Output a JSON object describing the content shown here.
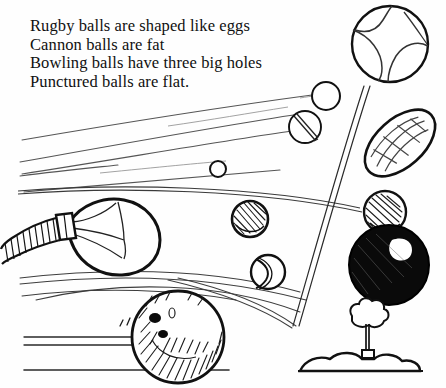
{
  "page": {
    "width": 446,
    "height": 388,
    "background_color": "#fefefe",
    "ink_color": "#111111",
    "faint_ink_color": "#555555"
  },
  "caption": {
    "lines": [
      "Rugby balls are shaped like eggs",
      "Cannon balls are fat",
      "Bowling balls have three big holes",
      "Punctured balls are flat."
    ]
  },
  "illustration": {
    "title": "Hand-drawn line illustration of assorted balls",
    "objects": [
      {
        "name": "tennis-ball",
        "label": "Tennis ball with curved seams",
        "cx": 390,
        "cy": 44,
        "r": 38
      },
      {
        "name": "rugby-ball",
        "label": "Rugby ball shaped like an egg",
        "cx": 400,
        "cy": 143,
        "rx": 40,
        "ry": 23,
        "rotation": -42
      },
      {
        "name": "cannon-ball",
        "label": "Cannon ball, solid black and fat",
        "cx": 389,
        "cy": 265,
        "r": 40
      },
      {
        "name": "bowling-ball",
        "label": "Bowling ball with three big holes",
        "cx": 178,
        "cy": 337,
        "r": 46
      },
      {
        "name": "punctured-ball",
        "label": "Punctured ball, flat deflated balloon",
        "cx": 115,
        "cy": 235,
        "rx": 42,
        "ry": 32
      },
      {
        "name": "shaded-ball-small",
        "label": "Small hatched ball",
        "cx": 250,
        "cy": 219,
        "r": 18
      },
      {
        "name": "seam-ball",
        "label": "Ball with S-curve seam",
        "cx": 268,
        "cy": 272,
        "r": 17
      },
      {
        "name": "hatched-ball-right",
        "label": "Hatched shaded ball",
        "cx": 385,
        "cy": 212,
        "r": 21
      },
      {
        "name": "plain-ball-upper",
        "label": "Small plain circle",
        "cx": 326,
        "cy": 96,
        "r": 14
      },
      {
        "name": "slashed-ball",
        "label": "Small circle with slash",
        "cx": 305,
        "cy": 127,
        "r": 16
      },
      {
        "name": "tiny-ball",
        "label": "Tiny circle",
        "cx": 218,
        "cy": 169,
        "r": 8
      },
      {
        "name": "tree",
        "label": "Small tree on a mound",
        "cx": 366,
        "cy": 325
      },
      {
        "name": "ground-mound",
        "label": "Mound of earth",
        "cx": 355,
        "cy": 365
      },
      {
        "name": "ground-line-left",
        "label": "Ground line under bowling ball",
        "y": 370
      }
    ]
  }
}
